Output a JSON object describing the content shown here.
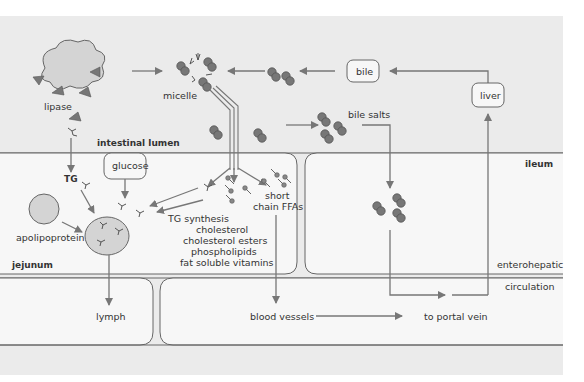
{
  "labels": {
    "lipase": "lipase",
    "micelle": "micelle",
    "bile": "bile",
    "liver": "liver",
    "bile_salts": "bile salts",
    "intestinal_lumen": "intestinal lumen",
    "glucose": "glucose",
    "tg": "TG",
    "apolipoprotein": "apolipoprotein",
    "short_chain_1": "short",
    "short_chain_2": "chain FFAs",
    "synthesis": [
      "TG synthesis",
      "cholesterol",
      "cholesterol esters",
      "phospholipids",
      "fat soluble vitamins"
    ],
    "jejunum": "jejunum",
    "ileum": "ileum",
    "enterohepatic": "enterohepatic",
    "circulation": "circulation",
    "lymph": "lymph",
    "blood_vessels": "blood vessels",
    "portal_vein": "to portal vein"
  },
  "colors": {
    "background": "#ebebeb",
    "cell": "#f7f7f7",
    "stroke": "#666666",
    "arrow": "#777777",
    "molecule": "#777777",
    "blob": "#d4d4d4"
  }
}
